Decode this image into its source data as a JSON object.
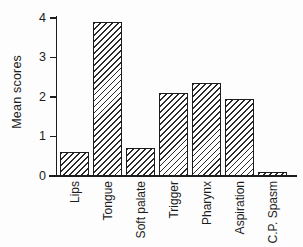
{
  "figure": {
    "colors": {
      "ink": "#1c1c1c",
      "background": "#fdfdfd",
      "bar_fill": "#ffffff"
    },
    "bar_pattern": "diagonal-hatch-forward-slash"
  },
  "chart_data": {
    "type": "bar",
    "title": "",
    "xlabel": "",
    "ylabel": "Mean scores",
    "categories": [
      "Lips",
      "Tongue",
      "Soft palate",
      "Trigger",
      "Pharynx",
      "Aspiration",
      "C.P. Spasm"
    ],
    "values": [
      0.6,
      3.9,
      0.7,
      2.1,
      2.35,
      1.95,
      0.1
    ],
    "ylim": [
      0,
      4
    ],
    "yticks": [
      0,
      1,
      2,
      3,
      4
    ],
    "grid": false,
    "legend": null,
    "x_tick_rotation": 90
  }
}
